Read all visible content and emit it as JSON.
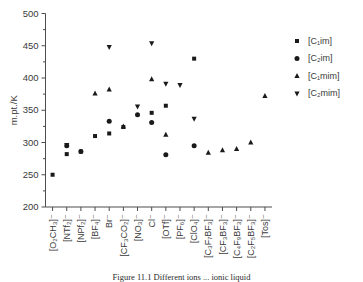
{
  "chart_data": {
    "type": "scatter",
    "title": "",
    "xlabel": "",
    "ylabel": "m.pt./K",
    "ylim": [
      200,
      500
    ],
    "ytick_values": [
      200,
      250,
      300,
      350,
      400,
      450,
      500
    ],
    "grid": false,
    "legend_position": "right",
    "categories": [
      "[O₂CH₃]⁻",
      "[NTf₂]⁻",
      "[NPf₂]⁻",
      "[BF₄]⁻",
      "Br⁻",
      "[CF₃CO₂]⁻",
      "[NO₃]⁻",
      "Cl⁻",
      "[OTf]⁻",
      "[PF₆]⁻",
      "[ClO₄]⁻",
      "[C₃F₇BF₃]⁻",
      "[CF₃BF₃]⁻",
      "[C₄F₉BF₃]⁻",
      "[C₂F₅BF₃]⁻",
      "[Tos]⁻"
    ],
    "series": [
      {
        "name": "[C₁im]",
        "marker": "square",
        "points": [
          {
            "category": "[O₂CH₃]⁻",
            "value": 250
          },
          {
            "category": "[NTf₂]⁻",
            "value": 282
          },
          {
            "category": "[NPf₂]⁻",
            "value": 286
          },
          {
            "category": "[BF₄]⁻",
            "value": 310
          },
          {
            "category": "Br⁻",
            "value": 314
          },
          {
            "category": "[CF₃CO₂]⁻",
            "value": 324
          },
          {
            "category": "Cl⁻",
            "value": 346
          },
          {
            "category": "[OTf]⁻",
            "value": 357
          },
          {
            "category": "[ClO₄]⁻",
            "value": 430
          }
        ]
      },
      {
        "name": "[C₂im]",
        "marker": "circle",
        "points": [
          {
            "category": "[NTf₂]⁻",
            "value": 295
          },
          {
            "category": "[NPf₂]⁻",
            "value": 286
          },
          {
            "category": "Br⁻",
            "value": 333
          },
          {
            "category": "[NO₃]⁻",
            "value": 343
          },
          {
            "category": "Cl⁻",
            "value": 331
          },
          {
            "category": "[OTf]⁻",
            "value": 281
          },
          {
            "category": "[ClO₄]⁻",
            "value": 295
          }
        ]
      },
      {
        "name": "[C₁mim]",
        "marker": "triangle-up",
        "points": [
          {
            "category": "[BF₄]⁻",
            "value": 376
          },
          {
            "category": "Br⁻",
            "value": 382
          },
          {
            "category": "[CF₃CO₂]⁻",
            "value": 325
          },
          {
            "category": "Cl⁻",
            "value": 398
          },
          {
            "category": "[OTf]⁻",
            "value": 312
          },
          {
            "category": "[C₃F₇BF₃]⁻",
            "value": 284
          },
          {
            "category": "[CF₃BF₃]⁻",
            "value": 288
          },
          {
            "category": "[C₄F₉BF₃]⁻",
            "value": 290
          },
          {
            "category": "[C₂F₅BF₃]⁻",
            "value": 300
          },
          {
            "category": "[Tos]⁻",
            "value": 372
          }
        ]
      },
      {
        "name": "[C₂mim]",
        "marker": "triangle-down",
        "points": [
          {
            "category": "[NTf₂]⁻",
            "value": 296
          },
          {
            "category": "Br⁻",
            "value": 448
          },
          {
            "category": "[NO₃]⁻",
            "value": 356
          },
          {
            "category": "Cl⁻",
            "value": 454
          },
          {
            "category": "[OTf]⁻",
            "value": 391
          },
          {
            "category": "[PF₆]⁻",
            "value": 389
          },
          {
            "category": "[ClO₄]⁻",
            "value": 337
          }
        ]
      }
    ]
  },
  "legend": {
    "entries": [
      {
        "label": "[C₁im]",
        "marker": "square"
      },
      {
        "label": "[C₂im]",
        "marker": "circle"
      },
      {
        "label": "[C₁mim]",
        "marker": "triangle-up"
      },
      {
        "label": "[C₂mim]",
        "marker": "triangle-down"
      }
    ]
  },
  "caption": {
    "text": "Figure  11.1   Different ions ... ionic liquid"
  },
  "colors": {
    "marker": "#1a1a1a",
    "axis": "#4d4d4d",
    "text": "#3a3a3a",
    "background": "#ffffff"
  }
}
